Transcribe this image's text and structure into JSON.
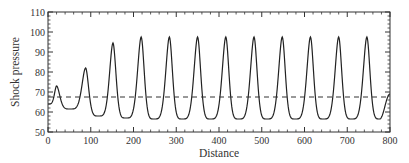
{
  "chart_data": {
    "type": "line",
    "title": "",
    "xlabel": "Distance",
    "ylabel": "Shock pressure",
    "xlim": [
      0,
      800
    ],
    "ylim": [
      50,
      110
    ],
    "x_ticks": [
      0,
      100,
      200,
      300,
      400,
      500,
      600,
      700,
      800
    ],
    "y_ticks": [
      50,
      60,
      70,
      80,
      90,
      100,
      110
    ],
    "grid": false,
    "legend": null,
    "series": [
      {
        "name": "shock pressure",
        "style": "solid",
        "peaks": [
          {
            "x": 20,
            "y": 73
          },
          {
            "x": 88,
            "y": 82
          },
          {
            "x": 152,
            "y": 94.5
          },
          {
            "x": 218,
            "y": 97.5
          },
          {
            "x": 284,
            "y": 97.5
          },
          {
            "x": 350,
            "y": 97.5
          },
          {
            "x": 416,
            "y": 97.5
          },
          {
            "x": 482,
            "y": 97.5
          },
          {
            "x": 548,
            "y": 97.5
          },
          {
            "x": 614,
            "y": 97.5
          },
          {
            "x": 680,
            "y": 97.5
          },
          {
            "x": 746,
            "y": 97.5
          }
        ],
        "troughs": [
          {
            "x": 0,
            "y": 64
          },
          {
            "x": 52,
            "y": 61.5
          },
          {
            "x": 118,
            "y": 58
          },
          {
            "x": 182,
            "y": 57
          },
          {
            "x": 248,
            "y": 56.5
          },
          {
            "x": 314,
            "y": 56.5
          },
          {
            "x": 380,
            "y": 56.5
          },
          {
            "x": 446,
            "y": 56.5
          },
          {
            "x": 512,
            "y": 56.5
          },
          {
            "x": 578,
            "y": 56.5
          },
          {
            "x": 644,
            "y": 56.5
          },
          {
            "x": 710,
            "y": 56.5
          },
          {
            "x": 776,
            "y": 56.5
          },
          {
            "x": 800,
            "y": 69
          }
        ]
      },
      {
        "name": "reference level",
        "style": "dashed",
        "x": [
          0,
          800
        ],
        "values": [
          67.5,
          67.5
        ]
      }
    ]
  }
}
